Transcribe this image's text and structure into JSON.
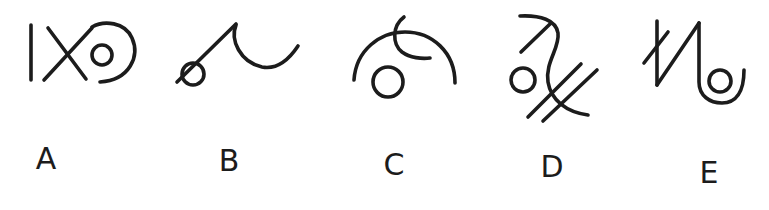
{
  "figure": {
    "type": "symbol-option-set",
    "stroke_color": "#1c1c1c",
    "background": "#ffffff",
    "options": [
      {
        "label": "A",
        "description": "vertical bar, X cross, small circle inside open large arc"
      },
      {
        "label": "B",
        "description": "diagonal line joined at apex to a U-shaped curve, small circle below diagonal"
      },
      {
        "label": "C",
        "description": "large open arch with a small hook arc crossing its top, small circle beneath"
      },
      {
        "label": "D",
        "description": "S-shaped curved stroke with an arrow-like diagonal at top, small circle at left, two parallel diagonals crossing the stroke"
      },
      {
        "label": "E",
        "description": "zigzag N-shape with a crossbar stroke, ending in a U-curve enclosing a small circle"
      }
    ]
  }
}
